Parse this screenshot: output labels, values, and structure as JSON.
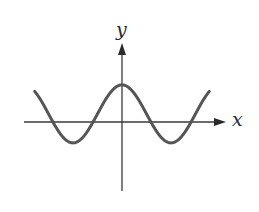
{
  "chart_data": {
    "type": "line",
    "title": "",
    "xlabel": "x",
    "ylabel": "y",
    "function_description": "even periodic curve resembling y = cos(x) + 0.28, with a central maximum at x = 0 and two minima symmetric about the y-axis",
    "xlim": [
      -6.2,
      6.2
    ],
    "ylim": [
      -2.6,
      2.7
    ],
    "grid": false,
    "ticks": "none",
    "legend": "none",
    "curve_domain": [
      -5.6,
      5.6
    ],
    "key_points": [
      {
        "label": "left endpoint",
        "x": -5.6,
        "y": 1.05
      },
      {
        "label": "left zero crossing (outer)",
        "x": -4.43,
        "y": 0
      },
      {
        "label": "left minimum",
        "x": -3.14,
        "y": -0.72
      },
      {
        "label": "left zero crossing (inner)",
        "x": -1.85,
        "y": 0
      },
      {
        "label": "central maximum",
        "x": 0,
        "y": 1.28
      },
      {
        "label": "right zero crossing (inner)",
        "x": 1.85,
        "y": 0
      },
      {
        "label": "right minimum",
        "x": 3.14,
        "y": -0.72
      },
      {
        "label": "right zero crossing (outer)",
        "x": 4.43,
        "y": 0
      },
      {
        "label": "right endpoint",
        "x": 5.6,
        "y": 1.05
      }
    ],
    "series": [
      {
        "name": "curve",
        "amplitude": 1.0,
        "vertical_offset": 0.28,
        "period": 6.283,
        "color": "#555555"
      }
    ]
  },
  "figure": {
    "x_axis_label": "x",
    "y_axis_label": "y",
    "axis_color": "#3a3a3a",
    "curve_color": "#555555"
  }
}
